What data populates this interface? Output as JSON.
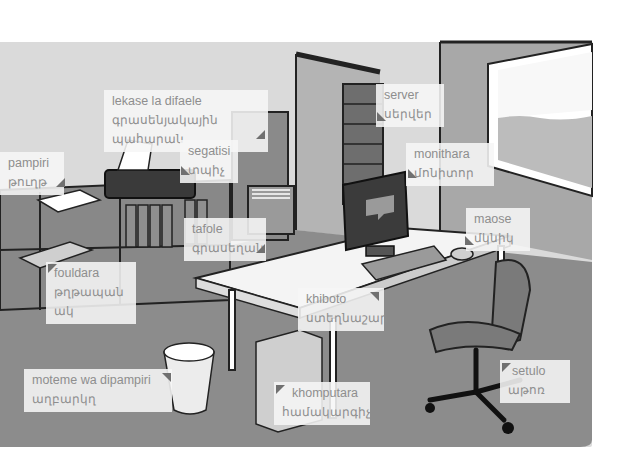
{
  "scene": {
    "description": "Illustrated office vocabulary picture",
    "colors": {
      "wall_light": "#dcdcdc",
      "wall_mid": "#a9a9a9",
      "floor": "#8a8a8a",
      "label_bg": "#f5f5f5",
      "label_text": "#8e8e8e",
      "marker": "#707070"
    }
  },
  "labels": [
    {
      "id": "printer",
      "line1": "lekase la difaele",
      "line2": "գրասենյակային պահարան"
    },
    {
      "id": "paper",
      "line1": "pampiri",
      "line2": "թուղթ"
    },
    {
      "id": "stapler",
      "line1": "segatisi",
      "line2": "տպիչ"
    },
    {
      "id": "server",
      "line1": "server",
      "line2": "սերվեր"
    },
    {
      "id": "monitor",
      "line1": "monithara",
      "line2": "մոնիտոր"
    },
    {
      "id": "desk",
      "line1": "tafole",
      "line2": "գրասեղան"
    },
    {
      "id": "folder",
      "line1": "fouldara",
      "line2": "թղթապանակ"
    },
    {
      "id": "mouse",
      "line1": "maose",
      "line2": "մկնիկ"
    },
    {
      "id": "keyboard",
      "line1": "khiboto",
      "line2": "ստեղնաշար"
    },
    {
      "id": "wastebasket",
      "line1": "moteme wa dipampiri",
      "line2": "աղբարկղ"
    },
    {
      "id": "computer",
      "line1": "khomputara",
      "line2": "համակարգիչ"
    },
    {
      "id": "chair",
      "line1": "setulo",
      "line2": "աթոռ"
    }
  ]
}
